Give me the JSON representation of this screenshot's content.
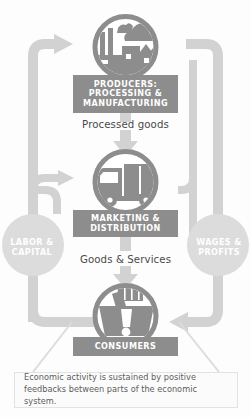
{
  "diagram": {
    "colors": {
      "plaque_fill": "#8d8d8d",
      "icon_fill": "#8d8d8d",
      "arrow_fill": "#d2d2d2",
      "side_circle_fill": "#dcdcdc",
      "caption_text": "#5d5d5d",
      "flow_text": "#4a4a4a",
      "background": "#fdfdfd"
    },
    "nodes": [
      {
        "id": "producers",
        "label": "PRODUCERS: PROCESSING & MANUFACTURING",
        "icon": "factory-icon"
      },
      {
        "id": "marketing",
        "label": "MARKETING & DISTRIBUTION",
        "icon": "delivery-truck-icon"
      },
      {
        "id": "consumers",
        "label": "CONSUMERS",
        "icon": "shopping-basket-icon"
      }
    ],
    "flow_labels": [
      {
        "id": "processed-goods",
        "text": "Processed goods"
      },
      {
        "id": "goods-services",
        "text": "Goods & Services"
      }
    ],
    "side_circles": [
      {
        "id": "labor-capital",
        "label": "LABOR & CAPITAL",
        "side": "left"
      },
      {
        "id": "wages-profits",
        "label": "WAGES & PROFITS",
        "side": "right"
      }
    ],
    "caption": {
      "text": "Economic activity is sustained by positive feedbacks between parts of the economic system."
    }
  }
}
